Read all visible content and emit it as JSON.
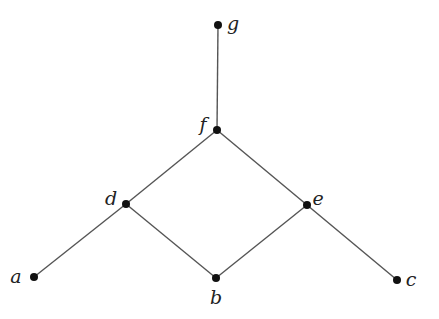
{
  "diagram": {
    "type": "hasse-diagram",
    "nodes": [
      {
        "id": "a",
        "label": "a",
        "x": 34,
        "y": 277,
        "label_x": 16,
        "label_y": 283,
        "anchor": "middle"
      },
      {
        "id": "b",
        "label": "b",
        "x": 216,
        "y": 278,
        "label_x": 216,
        "label_y": 304,
        "anchor": "middle"
      },
      {
        "id": "c",
        "label": "c",
        "x": 397,
        "y": 280,
        "label_x": 411,
        "label_y": 286,
        "anchor": "middle"
      },
      {
        "id": "d",
        "label": "d",
        "x": 126,
        "y": 204,
        "label_x": 111,
        "label_y": 205,
        "anchor": "middle"
      },
      {
        "id": "e",
        "label": "e",
        "x": 307,
        "y": 205,
        "label_x": 318,
        "label_y": 205,
        "anchor": "middle"
      },
      {
        "id": "f",
        "label": "f",
        "x": 217,
        "y": 130,
        "label_x": 203,
        "label_y": 131,
        "anchor": "middle"
      },
      {
        "id": "g",
        "label": "g",
        "x": 218,
        "y": 25,
        "label_x": 233,
        "label_y": 30,
        "anchor": "middle"
      }
    ],
    "edges": [
      {
        "from": "a",
        "to": "d"
      },
      {
        "from": "d",
        "to": "f"
      },
      {
        "from": "d",
        "to": "b"
      },
      {
        "from": "b",
        "to": "e"
      },
      {
        "from": "e",
        "to": "f"
      },
      {
        "from": "e",
        "to": "c"
      },
      {
        "from": "f",
        "to": "g"
      }
    ],
    "colors": {
      "edge": "#555555",
      "node": "#111111",
      "label": "#222222"
    }
  }
}
